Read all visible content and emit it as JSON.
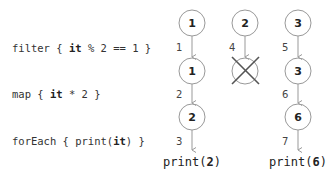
{
  "operations": [
    {
      "name": "filter",
      "prefix": "filter { ",
      "bold": "it",
      "suffix": " % 2 == 1 }"
    },
    {
      "name": "map",
      "prefix": "map { ",
      "bold": "it",
      "suffix": " * 2 }"
    },
    {
      "name": "forEach",
      "prefix": "forEach { print(",
      "bold": "it",
      "suffix": ") }"
    }
  ],
  "columns": [
    {
      "input": "1",
      "after_filter": "1",
      "after_map": "2",
      "output_prefix": "print(",
      "output_value": "2",
      "output_suffix": ")",
      "steps": [
        "1",
        "2",
        "3"
      ]
    },
    {
      "input": "2",
      "filtered_out": true,
      "steps": [
        "4"
      ]
    },
    {
      "input": "3",
      "after_filter": "3",
      "after_map": "6",
      "output_prefix": "print(",
      "output_value": "6",
      "output_suffix": ")",
      "steps": [
        "5",
        "6",
        "7"
      ]
    }
  ],
  "colors": {
    "stroke": "#999999",
    "text": "#222222",
    "cross": "#555555"
  }
}
